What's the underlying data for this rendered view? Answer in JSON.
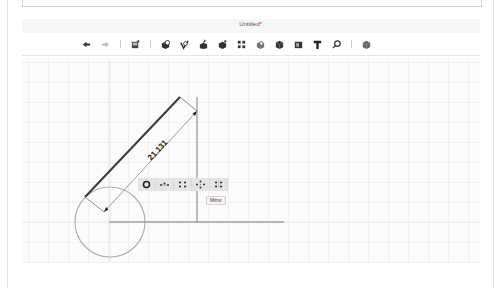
{
  "document": {
    "title": "Untitled*"
  },
  "toolbar": {
    "items": [
      {
        "name": "undo",
        "icon": "undo-icon",
        "glyph": "↶"
      },
      {
        "name": "redo",
        "icon": "redo-icon",
        "glyph": "↷"
      },
      {
        "name": "new-part",
        "icon": "new-part-icon"
      },
      {
        "name": "extrude",
        "icon": "extrude-icon"
      },
      {
        "name": "fillet",
        "icon": "fillet-icon"
      },
      {
        "name": "revolve",
        "icon": "revolve-icon"
      },
      {
        "name": "sweep",
        "icon": "sweep-icon"
      },
      {
        "name": "pattern",
        "icon": "pattern-icon"
      },
      {
        "name": "shell",
        "icon": "shell-icon"
      },
      {
        "name": "solid",
        "icon": "solid-icon"
      },
      {
        "name": "boolean",
        "icon": "boolean-icon"
      },
      {
        "name": "text",
        "icon": "text-icon",
        "glyph": "T"
      },
      {
        "name": "measure",
        "icon": "measure-icon"
      },
      {
        "name": "view",
        "icon": "view-cube-icon"
      }
    ]
  },
  "sketch": {
    "dimension_value": "21.131",
    "colors": {
      "line": "#3a3a3a",
      "construction": "#a6a6a6",
      "circle": "#b0b0b0"
    }
  },
  "context_toolbar": {
    "items": [
      {
        "name": "concentric",
        "icon": "concentric-icon"
      },
      {
        "name": "horizontal-distance",
        "icon": "horizontal-distance-icon"
      },
      {
        "name": "pattern",
        "icon": "grid-pattern-icon"
      },
      {
        "name": "circular-pattern",
        "icon": "circular-pattern-icon"
      },
      {
        "name": "mirror",
        "icon": "mirror-icon"
      }
    ],
    "tooltip": "Mirror"
  }
}
